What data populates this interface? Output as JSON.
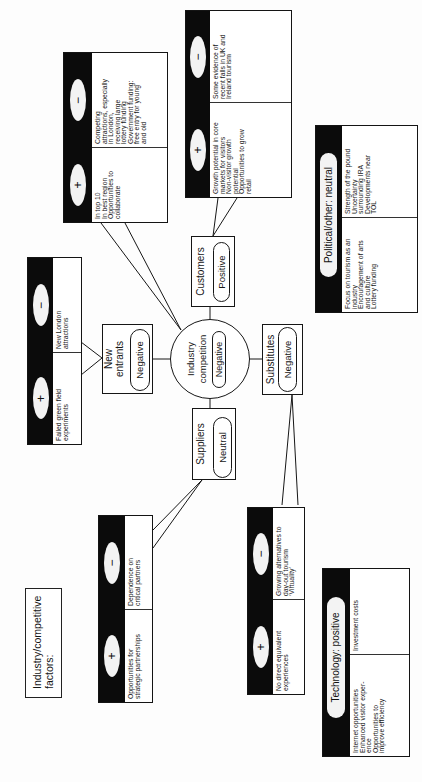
{
  "title": [
    "Industry/competitive",
    "factors:"
  ],
  "symbols": {
    "plus": "+",
    "minus": "−"
  },
  "colors": {
    "header_fill": "#0b0b0b",
    "line": "#161616",
    "background": "#ffffff"
  },
  "industry_competition": {
    "label": [
      "Industry",
      "competition"
    ],
    "rating": "Negative",
    "pros": [
      "In top 10",
      "In best region",
      "Opportunities to",
      "collaborate"
    ],
    "cons": [
      "Competing",
      "attractions, especially",
      "in London,",
      "receiving large",
      "lottery funding",
      "Government funding:",
      "free entry for young",
      "and old"
    ]
  },
  "new_entrants": {
    "label": [
      "New",
      "entrants"
    ],
    "rating": "Negative",
    "pros": [
      "Failed green field",
      "experiments"
    ],
    "cons": [
      "New London",
      "attractions"
    ]
  },
  "suppliers": {
    "label": [
      "Suppliers"
    ],
    "rating": "Neutral",
    "pros": [
      "Opportunities for",
      "strategic partnerships"
    ],
    "cons": [
      "Dependence on",
      "critical partners"
    ]
  },
  "customers": {
    "label": [
      "Customers"
    ],
    "rating": "Positive",
    "pros": [
      "Growth potential in core",
      "markets for visitors",
      "Non-visitor growth",
      "potential",
      "Opportunities to grow",
      "retail"
    ],
    "cons": [
      "Some evidence of",
      "recent falls in UK and",
      "Ireland tourism"
    ]
  },
  "substitutes": {
    "label": [
      "Substitutes"
    ],
    "rating": "Negative",
    "pros": [
      "No direct equivalent",
      "experiences"
    ],
    "cons": [
      "Growing alternatives to",
      "day-out tourism",
      "‘Virtuality’"
    ]
  },
  "technology": {
    "heading": "Technology: positive",
    "positives": [
      "Internet opportunities",
      "Enhanced visitor exper-",
      "ence",
      "Opportunities to",
      "improve efficiency"
    ],
    "negatives": [
      "Investment costs"
    ]
  },
  "political_other": {
    "heading": "Political/other: neutral",
    "positives": [
      "Focus on tourism as an",
      "industry",
      "Encouragement of arts",
      "and culture",
      "Lottery funding"
    ],
    "negatives": [
      "Strength of the pound",
      "Uncertainty",
      "surrounding IRA",
      "Developments near",
      "TOL"
    ]
  }
}
